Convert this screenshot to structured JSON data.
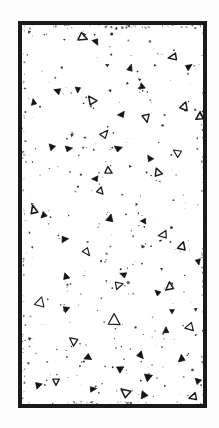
{
  "figure": {
    "kind": "micrograph",
    "caption": "",
    "width_px": 219,
    "height_px": 428,
    "background_color": "#ffffff",
    "paper_color": "#fdfdfd"
  },
  "frame": {
    "x": 18,
    "y": 21,
    "width": 189,
    "height": 387,
    "border_width_px": 4,
    "border_color": "#1a1a1a",
    "fill_color": "#ffffff"
  },
  "field": {
    "matrix_color": "#ffffff",
    "particle_color": "#141414",
    "particle_outline_color": "#1c1c1c",
    "speck_color": "#2b2b2b",
    "grain_opacity": 0.2
  },
  "chart_data": {
    "type": "scatter",
    "title": "",
    "subtitle": "",
    "xlabel": "",
    "ylabel": "",
    "xlim": [
      0,
      181
    ],
    "ylim": [
      0,
      379
    ],
    "grid": false,
    "legend": null,
    "annotations": [],
    "series": [
      {
        "name": "triangular-grains-outlined",
        "marker": "triangle-open",
        "color": "#1c1c1c",
        "points": [
          {
            "x": 60,
            "y": 12,
            "size": 8
          },
          {
            "x": 152,
            "y": 32,
            "size": 8
          },
          {
            "x": 70,
            "y": 76,
            "size": 8
          },
          {
            "x": 162,
            "y": 82,
            "size": 7
          },
          {
            "x": 178,
            "y": 92,
            "size": 7
          },
          {
            "x": 82,
            "y": 110,
            "size": 8
          },
          {
            "x": 124,
            "y": 92,
            "size": 7
          },
          {
            "x": 156,
            "y": 128,
            "size": 8
          },
          {
            "x": 86,
            "y": 146,
            "size": 7
          },
          {
            "x": 136,
            "y": 148,
            "size": 7
          },
          {
            "x": 78,
            "y": 166,
            "size": 7
          },
          {
            "x": 12,
            "y": 186,
            "size": 8
          },
          {
            "x": 142,
            "y": 210,
            "size": 8
          },
          {
            "x": 160,
            "y": 222,
            "size": 8
          },
          {
            "x": 64,
            "y": 226,
            "size": 8
          },
          {
            "x": 96,
            "y": 260,
            "size": 8
          },
          {
            "x": 148,
            "y": 262,
            "size": 7
          },
          {
            "x": 18,
            "y": 278,
            "size": 9
          },
          {
            "x": 92,
            "y": 296,
            "size": 10
          },
          {
            "x": 168,
            "y": 302,
            "size": 8
          },
          {
            "x": 52,
            "y": 316,
            "size": 7
          },
          {
            "x": 34,
            "y": 356,
            "size": 8
          },
          {
            "x": 104,
            "y": 368,
            "size": 9
          },
          {
            "x": 172,
            "y": 372,
            "size": 7
          }
        ]
      },
      {
        "name": "triangular-grains-solid",
        "marker": "triangle-filled",
        "color": "#141414",
        "points": [
          {
            "x": 74,
            "y": 16,
            "size": 6
          },
          {
            "x": 108,
            "y": 44,
            "size": 7
          },
          {
            "x": 166,
            "y": 42,
            "size": 6
          },
          {
            "x": 36,
            "y": 66,
            "size": 6
          },
          {
            "x": 56,
            "y": 64,
            "size": 6
          },
          {
            "x": 120,
            "y": 62,
            "size": 6
          },
          {
            "x": 12,
            "y": 78,
            "size": 6
          },
          {
            "x": 100,
            "y": 90,
            "size": 6
          },
          {
            "x": 30,
            "y": 122,
            "size": 7
          },
          {
            "x": 46,
            "y": 124,
            "size": 6
          },
          {
            "x": 96,
            "y": 124,
            "size": 6
          },
          {
            "x": 128,
            "y": 134,
            "size": 6
          },
          {
            "x": 74,
            "y": 154,
            "size": 6
          },
          {
            "x": 22,
            "y": 190,
            "size": 6
          },
          {
            "x": 88,
            "y": 194,
            "size": 7
          },
          {
            "x": 122,
            "y": 196,
            "size": 6
          },
          {
            "x": 42,
            "y": 214,
            "size": 6
          },
          {
            "x": 176,
            "y": 236,
            "size": 6
          },
          {
            "x": 44,
            "y": 252,
            "size": 6
          },
          {
            "x": 102,
            "y": 250,
            "size": 6
          },
          {
            "x": 136,
            "y": 268,
            "size": 6
          },
          {
            "x": 44,
            "y": 284,
            "size": 6
          },
          {
            "x": 150,
            "y": 286,
            "size": 6
          },
          {
            "x": 144,
            "y": 306,
            "size": 6
          },
          {
            "x": 66,
            "y": 332,
            "size": 6
          },
          {
            "x": 118,
            "y": 330,
            "size": 7
          },
          {
            "x": 160,
            "y": 334,
            "size": 6
          },
          {
            "x": 98,
            "y": 344,
            "size": 6
          },
          {
            "x": 126,
            "y": 352,
            "size": 6
          },
          {
            "x": 16,
            "y": 360,
            "size": 6
          },
          {
            "x": 70,
            "y": 364,
            "size": 6
          },
          {
            "x": 122,
            "y": 370,
            "size": 6
          },
          {
            "x": 176,
            "y": 356,
            "size": 6
          }
        ]
      },
      {
        "name": "fine-specks",
        "marker": "dot",
        "color": "#2b2b2b",
        "point_count": 210
      }
    ]
  }
}
